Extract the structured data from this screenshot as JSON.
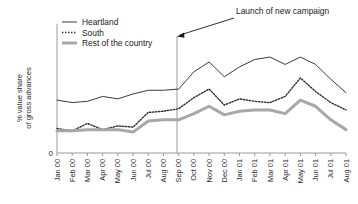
{
  "chart_data": {
    "type": "line",
    "title": "",
    "subtitle": "",
    "xlabel": "",
    "ylabel": "% value share\nof gross advances",
    "ylabel_line1": "% value share",
    "ylabel_line2": "of gross advances",
    "grid": false,
    "legend_position": "top-left",
    "ylim": [
      0,
      100
    ],
    "y_tick_labels": [
      "0"
    ],
    "y_tick_values": [
      0
    ],
    "categories": [
      "Jan 00",
      "Feb 00",
      "Mar 00",
      "Apr 00",
      "May 00",
      "Jun 00",
      "Jul 00",
      "Aug 00",
      "Sep 00",
      "Oct 00",
      "Nov 00",
      "Dec 00",
      "Jan 01",
      "Feb 01",
      "Mar 01",
      "Apr 01",
      "May 01",
      "Jun 01",
      "Jul 01",
      "Aug 01"
    ],
    "series": [
      {
        "name": "Heartland",
        "style": "solid",
        "color": "#3a3a3a",
        "width": 1,
        "values": [
          43,
          41,
          42,
          46,
          44,
          48,
          51,
          51,
          52,
          66,
          74,
          62,
          70,
          76,
          78,
          72,
          78,
          72,
          60,
          49
        ]
      },
      {
        "name": "South",
        "style": "dotted",
        "color": "#2e2e2e",
        "width": 1.4,
        "values": [
          20,
          18,
          24,
          19,
          22,
          21,
          33,
          34,
          36,
          45,
          52,
          39,
          44,
          42,
          41,
          46,
          61,
          50,
          41,
          35
        ]
      },
      {
        "name": "Rest of the country",
        "style": "solid",
        "color": "#a8a8a8",
        "width": 3,
        "values": [
          18,
          18,
          19,
          19,
          19,
          17,
          26,
          27,
          27,
          32,
          38,
          31,
          34,
          35,
          35,
          32,
          43,
          38,
          27,
          19
        ]
      }
    ],
    "annotations": [
      {
        "text": "Launch of new campaign",
        "target_category": "Sep 00",
        "kind": "vertical-line-with-arrow"
      }
    ]
  },
  "legend": {
    "items": [
      {
        "label": "Heartland"
      },
      {
        "label": "South"
      },
      {
        "label": "Rest of the country"
      }
    ]
  },
  "axes": {
    "y_zero_label": "0",
    "y_title_line1": "% value share",
    "y_title_line2": "of gross advances"
  },
  "annotation": {
    "label": "Launch of new campaign"
  }
}
